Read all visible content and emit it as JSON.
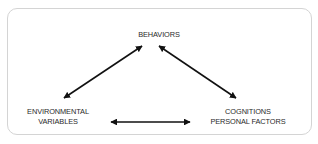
{
  "diagram": {
    "type": "triadic-reciprocal-relationship",
    "nodes": {
      "behaviors": {
        "lines": [
          "BEHAVIORS"
        ]
      },
      "environmental": {
        "lines": [
          "ENVIRONMENTAL",
          "VARIABLES"
        ]
      },
      "cognitions": {
        "lines": [
          "COGNITIONS",
          "PERSONAL FACTORS"
        ]
      }
    },
    "edges": [
      {
        "from": "behaviors",
        "to": "environmental",
        "direction": "bidirectional"
      },
      {
        "from": "behaviors",
        "to": "cognitions",
        "direction": "bidirectional"
      },
      {
        "from": "environmental",
        "to": "cognitions",
        "direction": "bidirectional"
      }
    ],
    "colors": {
      "arrow": "#111111",
      "text": "#2a2a2a",
      "border": "#d4d4d4",
      "background": "#ffffff"
    }
  }
}
